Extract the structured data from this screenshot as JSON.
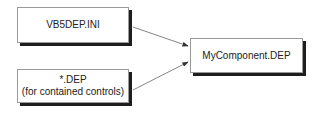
{
  "diagram": {
    "nodes": [
      {
        "id": "vb5dep",
        "lines": [
          "VB5DEP.INI"
        ]
      },
      {
        "id": "contained",
        "lines": [
          "*.DEP",
          "(for contained controls)"
        ]
      },
      {
        "id": "target",
        "lines": [
          "MyComponent.DEP"
        ]
      }
    ],
    "edges": [
      {
        "from": "vb5dep",
        "to": "target"
      },
      {
        "from": "contained",
        "to": "target"
      }
    ],
    "colors": {
      "border": "#9a9a9a",
      "shadow": "#1e1e1e",
      "arrow": "#555555"
    }
  }
}
